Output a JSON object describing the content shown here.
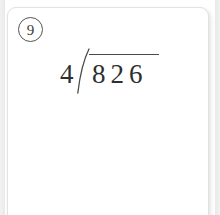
{
  "card": {
    "problem_number": "9",
    "background_color": "#ffffff",
    "border_color": "#e2e2e2",
    "ink_color": "#2f2f2f"
  },
  "problem": {
    "type": "long-division",
    "divisor": "4",
    "dividend": "826",
    "dividend_digits": [
      "8",
      "2",
      "6"
    ],
    "quotient": "",
    "expression": "826 ÷ 4",
    "bracket_icon": "division-bracket-icon"
  }
}
